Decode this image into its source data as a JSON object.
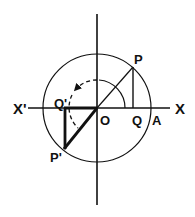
{
  "diagram": {
    "type": "unit-circle-trigonometry",
    "labels": {
      "x_pos": "X",
      "x_neg": "X'",
      "origin": "O",
      "point_p": "P",
      "point_q": "Q",
      "point_a": "A",
      "point_p_prime": "P'",
      "point_q_prime": "Q'"
    },
    "colors": {
      "stroke": "#111111",
      "background": "#ffffff"
    },
    "geometry": {
      "center": [
        97,
        108
      ],
      "radius": 54,
      "angle_arc_radius": 28,
      "P": [
        133,
        67
      ],
      "Q": [
        133,
        108
      ],
      "P_prime": [
        64,
        149
      ],
      "Q_prime": [
        64,
        108
      ]
    }
  }
}
